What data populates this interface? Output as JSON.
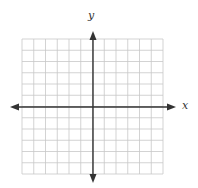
{
  "diagram": {
    "type": "coordinate-grid",
    "labels": {
      "x_axis": "x",
      "y_axis": "y"
    },
    "grid": {
      "columns": 12,
      "rows": 12,
      "left": 22,
      "right": 163,
      "top": 39,
      "bottom": 174,
      "origin": {
        "x": 93,
        "y": 107
      },
      "line_color": "#c8c8c8",
      "axis_color": "#333333"
    },
    "arrows": {
      "left_tip": 10,
      "right_tip": 176,
      "top_tip": 31,
      "bottom_tip": 183
    }
  }
}
